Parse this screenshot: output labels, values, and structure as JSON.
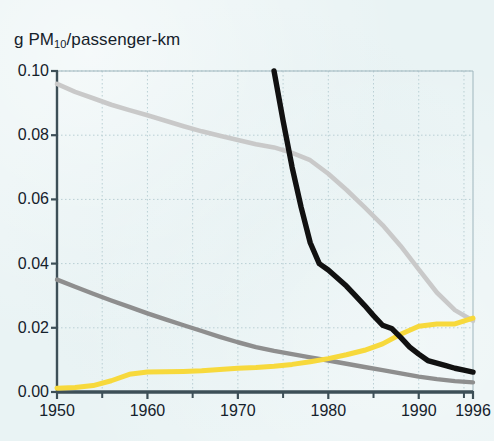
{
  "chart_data": {
    "type": "line",
    "title": "g PM10/passenger-km",
    "title_parts": {
      "prefix": "g PM",
      "sub": "10",
      "suffix": "/passenger-km"
    },
    "xlabel": "",
    "ylabel": "g PM10/passenger-km",
    "xlim": [
      1950,
      1996
    ],
    "ylim": [
      0.0,
      0.1
    ],
    "grid": true,
    "legend_position": "none",
    "y_ticks": [
      "0.00",
      "0.02",
      "0.04",
      "0.06",
      "0.08",
      "0.10"
    ],
    "y_tick_values": [
      0.0,
      0.02,
      0.04,
      0.06,
      0.08,
      0.1
    ],
    "x_ticks": [
      "1950",
      "1960",
      "1970",
      "1980",
      "1990",
      "1996"
    ],
    "x_tick_values": [
      1950,
      1960,
      1970,
      1980,
      1990,
      1996
    ],
    "x_minor_tick_values": [
      1955,
      1965,
      1975,
      1985,
      1995
    ],
    "colors": {
      "background": "#e9f3f4",
      "axis": "#3d4f57",
      "grid": "#b9cfd4",
      "light_gray_series": "#c9c9c9",
      "dark_gray_series": "#8e8e8e",
      "yellow_series": "#f7d93c",
      "black_series": "#111111"
    },
    "series": [
      {
        "name": "light-gray-series",
        "color": "#c9c9c9",
        "x": [
          1950,
          1952,
          1954,
          1956,
          1958,
          1960,
          1962,
          1964,
          1966,
          1968,
          1970,
          1972,
          1974,
          1976,
          1978,
          1980,
          1982,
          1984,
          1986,
          1988,
          1990,
          1992,
          1994,
          1996
        ],
        "values": [
          0.096,
          0.0935,
          0.0915,
          0.0895,
          0.0878,
          0.0862,
          0.0845,
          0.0828,
          0.0812,
          0.0798,
          0.0785,
          0.0772,
          0.0762,
          0.0745,
          0.0722,
          0.068,
          0.063,
          0.0576,
          0.052,
          0.0455,
          0.0382,
          0.031,
          0.0255,
          0.0222
        ]
      },
      {
        "name": "dark-gray-series",
        "color": "#8e8e8e",
        "x": [
          1950,
          1952,
          1954,
          1956,
          1958,
          1960,
          1962,
          1964,
          1966,
          1968,
          1970,
          1972,
          1974,
          1976,
          1978,
          1980,
          1982,
          1984,
          1986,
          1988,
          1990,
          1992,
          1994,
          1996
        ],
        "values": [
          0.035,
          0.0328,
          0.0306,
          0.0285,
          0.0265,
          0.0245,
          0.0226,
          0.0208,
          0.019,
          0.0172,
          0.0155,
          0.014,
          0.0128,
          0.0118,
          0.0108,
          0.0098,
          0.0088,
          0.0078,
          0.0068,
          0.0058,
          0.0048,
          0.004,
          0.0034,
          0.003
        ]
      },
      {
        "name": "yellow-series",
        "color": "#f7d93c",
        "x": [
          1950,
          1952,
          1954,
          1956,
          1958,
          1960,
          1962,
          1964,
          1966,
          1968,
          1970,
          1972,
          1974,
          1976,
          1978,
          1980,
          1982,
          1984,
          1986,
          1988,
          1990,
          1992,
          1994,
          1996
        ],
        "values": [
          0.0012,
          0.0014,
          0.002,
          0.0035,
          0.0055,
          0.0062,
          0.0063,
          0.0064,
          0.0066,
          0.007,
          0.0074,
          0.0076,
          0.008,
          0.0086,
          0.0094,
          0.0104,
          0.0116,
          0.013,
          0.015,
          0.018,
          0.0205,
          0.0212,
          0.0212,
          0.023
        ]
      },
      {
        "name": "black-series",
        "color": "#111111",
        "x": [
          1974,
          1975,
          1976,
          1977,
          1978,
          1979,
          1980,
          1981,
          1982,
          1983,
          1984,
          1985,
          1986,
          1987,
          1988,
          1989,
          1990,
          1991,
          1992,
          1993,
          1994,
          1995,
          1996
        ],
        "values": [
          0.1,
          0.0845,
          0.07,
          0.0575,
          0.0465,
          0.04,
          0.038,
          0.0355,
          0.033,
          0.03,
          0.027,
          0.0238,
          0.0208,
          0.0198,
          0.017,
          0.014,
          0.0118,
          0.0098,
          0.009,
          0.0082,
          0.0074,
          0.0068,
          0.0062
        ]
      }
    ]
  }
}
